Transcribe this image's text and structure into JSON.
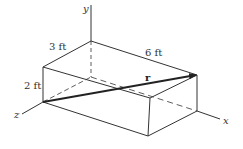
{
  "diagram": {
    "type": "3d-box-position-vector",
    "axes": {
      "x": "x",
      "y": "y",
      "z": "z"
    },
    "dimensions": {
      "depth_label": "3 ft",
      "length_label": "6 ft",
      "height_label": "2 ft"
    },
    "vector": {
      "label": "r",
      "from": "front-bottom-left corner on z-axis",
      "to": "top-right-back corner"
    },
    "colors": {
      "line": "#222222",
      "background": "#ffffff"
    }
  }
}
